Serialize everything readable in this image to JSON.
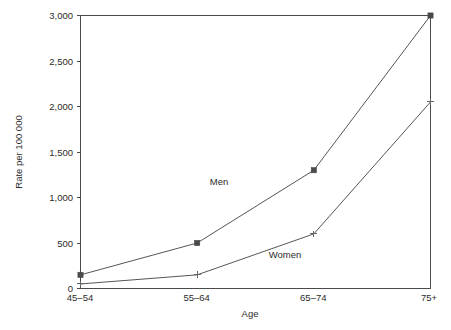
{
  "chart_data": {
    "type": "line",
    "title": "",
    "subtitle": "",
    "xlabel": "Age",
    "ylabel": "Rate per 100 000",
    "categories": [
      "45–54",
      "55–64",
      "65–74",
      "75+"
    ],
    "ylim": [
      0,
      3000
    ],
    "ytick_values": [
      0,
      500,
      1000,
      1500,
      2000,
      2500,
      3000
    ],
    "ytick_labels": [
      "0",
      "500",
      "1,000",
      "1,500",
      "2,000",
      "2,500",
      "3,000"
    ],
    "grid": false,
    "legend_position": "inline-annotations",
    "series": [
      {
        "name": "Men",
        "marker": "filled-square",
        "color": "#4a4a4a",
        "values": [
          150,
          500,
          1300,
          3000
        ]
      },
      {
        "name": "Women",
        "marker": "plus",
        "color": "#666666",
        "values": [
          50,
          150,
          600,
          2050
        ]
      }
    ],
    "annotations": [
      {
        "text": "Men",
        "series": "Men"
      },
      {
        "text": "Women",
        "series": "Women"
      }
    ]
  },
  "axes": {
    "y_title": "Rate per 100 000",
    "x_title": "Age",
    "y_tick_0": "0",
    "y_tick_1": "500",
    "y_tick_2": "1,000",
    "y_tick_3": "1,500",
    "y_tick_4": "2,000",
    "y_tick_5": "2,500",
    "y_tick_6": "3,000",
    "x_tick_0": "45–54",
    "x_tick_1": "55–64",
    "x_tick_2": "65–74",
    "x_tick_3": "75+"
  },
  "labels": {
    "men": "Men",
    "women": "Women"
  },
  "colors": {
    "background": "#ffffff",
    "frame": "#4a4a4a",
    "men_line": "#555555",
    "women_line": "#555555",
    "text": "#2b2b2b"
  }
}
